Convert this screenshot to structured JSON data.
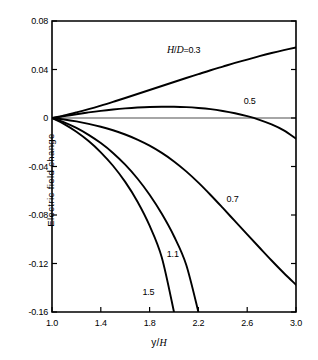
{
  "chart_data": {
    "type": "line",
    "title": "",
    "xlabel": "y/H",
    "ylabel": "Electric field change",
    "xlim": [
      1.0,
      3.0
    ],
    "ylim": [
      -0.16,
      0.08
    ],
    "grid": false,
    "legend_position": "inline-curve-labels",
    "xticks": [
      "1.0",
      "1.4",
      "1.8",
      "2.2",
      "2.6",
      "3.0"
    ],
    "xtick_values": [
      1.0,
      1.4,
      1.8,
      2.2,
      2.6,
      3.0
    ],
    "yticks": [
      "0.08",
      "0.04",
      "0",
      "-0.04",
      "-0.08",
      "-0.12",
      "-0.16"
    ],
    "ytick_values": [
      0.08,
      0.04,
      0,
      -0.04,
      -0.08,
      -0.12,
      -0.16
    ],
    "zero_line": true,
    "series": [
      {
        "name": "H/D = 0.3",
        "label": "0.3",
        "label_prefix": "H/D",
        "label_equals": "=",
        "x": [
          1.0,
          1.1,
          1.2,
          1.3,
          1.4,
          1.5,
          1.6,
          1.7,
          1.8,
          1.9,
          2.0,
          2.1,
          2.2,
          2.3,
          2.4,
          2.5,
          2.6,
          2.7,
          2.8,
          2.9,
          3.0
        ],
        "values": [
          0.0,
          0.0021,
          0.0046,
          0.0073,
          0.0102,
          0.0133,
          0.0165,
          0.0198,
          0.0231,
          0.0264,
          0.0297,
          0.033,
          0.0362,
          0.0394,
          0.0424,
          0.0454,
          0.0482,
          0.051,
          0.0536,
          0.056,
          0.0582
        ]
      },
      {
        "name": "H/D = 0.5",
        "label": "0.5",
        "x": [
          1.0,
          1.1,
          1.2,
          1.3,
          1.4,
          1.5,
          1.6,
          1.7,
          1.8,
          1.9,
          2.0,
          2.1,
          2.2,
          2.3,
          2.4,
          2.5,
          2.6,
          2.7,
          2.8,
          2.9,
          3.0
        ],
        "values": [
          0.0,
          0.0015,
          0.0031,
          0.0046,
          0.0059,
          0.007,
          0.0079,
          0.0086,
          0.0091,
          0.0093,
          0.0093,
          0.009,
          0.0083,
          0.0073,
          0.0058,
          0.0039,
          0.0015,
          -0.0015,
          -0.0053,
          -0.0102,
          -0.017
        ]
      },
      {
        "name": "H/D = 0.7",
        "label": "0.7",
        "x": [
          1.0,
          1.1,
          1.2,
          1.3,
          1.4,
          1.5,
          1.6,
          1.7,
          1.8,
          1.9,
          2.0,
          2.1,
          2.2,
          2.3,
          2.4,
          2.5,
          2.6,
          2.7,
          2.8,
          2.9,
          3.0
        ],
        "values": [
          0.0,
          -0.0012,
          -0.0028,
          -0.0048,
          -0.0072,
          -0.0101,
          -0.0136,
          -0.0178,
          -0.0228,
          -0.0288,
          -0.0358,
          -0.044,
          -0.0533,
          -0.0635,
          -0.0742,
          -0.0851,
          -0.096,
          -0.1068,
          -0.1175,
          -0.1278,
          -0.1375
        ]
      },
      {
        "name": "H/D = 1.1",
        "label": "1.1",
        "x": [
          1.0,
          1.1,
          1.2,
          1.3,
          1.4,
          1.5,
          1.6,
          1.7,
          1.8,
          1.9,
          2.0,
          2.1,
          2.2
        ],
        "values": [
          0.0,
          -0.0036,
          -0.0082,
          -0.0139,
          -0.0207,
          -0.0288,
          -0.0385,
          -0.0499,
          -0.0633,
          -0.079,
          -0.0975,
          -0.121,
          -0.16
        ]
      },
      {
        "name": "H/D = 1.5",
        "label": "1.5",
        "x": [
          1.0,
          1.1,
          1.2,
          1.3,
          1.4,
          1.5,
          1.6,
          1.7,
          1.8,
          1.9,
          2.0
        ],
        "values": [
          0.0,
          -0.005,
          -0.0113,
          -0.019,
          -0.0283,
          -0.0394,
          -0.0527,
          -0.0688,
          -0.0888,
          -0.115,
          -0.16
        ]
      }
    ],
    "curve_label_positions": [
      {
        "label_key": "hd03",
        "x": 2.08,
        "y": 0.0565
      },
      {
        "label_key": "l05",
        "x": 2.62,
        "y": 0.0138
      },
      {
        "label_key": "l07",
        "x": 2.48,
        "y": -0.0665
      },
      {
        "label_key": "l11",
        "x": 1.99,
        "y": -0.1125
      },
      {
        "label_key": "l15",
        "x": 1.79,
        "y": -0.1438
      }
    ],
    "colors": {
      "axis": "#000000",
      "curve": "#000000",
      "background": "#ffffff",
      "zero_line": "#000000"
    }
  }
}
